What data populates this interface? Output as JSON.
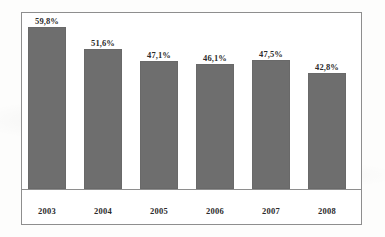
{
  "chart_data": {
    "type": "bar",
    "title": "",
    "subtitle": "",
    "xlabel": "",
    "ylabel": "",
    "categories": [
      "2003",
      "2004",
      "2005",
      "2006",
      "2007",
      "2008"
    ],
    "values": [
      59.8,
      51.6,
      47.1,
      46.1,
      47.5,
      42.8
    ],
    "value_labels": [
      "59,8%",
      "51,6%",
      "47,1%",
      "46,1%",
      "47,5%",
      "42,8%"
    ],
    "ylim": [
      0,
      62
    ],
    "grid": false,
    "legend": null,
    "legend_position": "none",
    "series": [
      {
        "name": "",
        "values": [
          59.8,
          51.6,
          47.1,
          46.1,
          47.5,
          42.8
        ]
      }
    ],
    "bar_color": "#6e6e6e",
    "frame_color": "#8e8e8e",
    "label_color": "#2b2b2b",
    "background_color": "#ffffff"
  }
}
